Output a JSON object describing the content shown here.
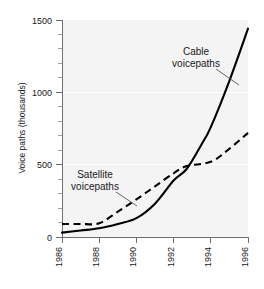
{
  "chart_data": {
    "type": "line",
    "title": "",
    "xlabel": "",
    "ylabel": "Voice paths (thousands)",
    "xlim": [
      1986,
      1996
    ],
    "ylim": [
      0,
      1500
    ],
    "grid": true,
    "legend_position": "inline-annotations",
    "x_ticks": [
      "1986",
      "1988",
      "1990",
      "1992",
      "1994",
      "1996"
    ],
    "x_tick_values": [
      1986,
      1988,
      1990,
      1992,
      1994,
      1996
    ],
    "y_ticks": [
      "0",
      "500",
      "1000",
      "1500"
    ],
    "y_tick_values": [
      0,
      500,
      1000,
      1500
    ],
    "y_minor_step": 100,
    "series": [
      {
        "name": "Cable voicepaths",
        "style": "solid",
        "color": "#000000",
        "x": [
          1986,
          1987,
          1988,
          1989,
          1990,
          1991,
          1992,
          1992.7,
          1993.5,
          1994,
          1995,
          1996
        ],
        "values": [
          30,
          45,
          60,
          90,
          130,
          230,
          390,
          470,
          640,
          760,
          1080,
          1440
        ]
      },
      {
        "name": "Satellite voicepaths",
        "style": "dashed",
        "color": "#000000",
        "x": [
          1986,
          1987,
          1988,
          1989,
          1990,
          1991,
          1992,
          1992.7,
          1994,
          1995,
          1996
        ],
        "values": [
          90,
          90,
          95,
          175,
          260,
          350,
          440,
          490,
          520,
          610,
          720
        ]
      }
    ],
    "annotations": [
      {
        "name": "cable-annotation",
        "line1": "Cable",
        "line2": "voicepaths",
        "text_x": 196,
        "text_y": 55,
        "leader": [
          [
            216,
            68
          ],
          [
            239,
            84
          ]
        ]
      },
      {
        "name": "satellite-annotation",
        "line1": "Satellite",
        "line2": "voicepaths",
        "text_x": 95,
        "text_y": 178,
        "leader": [
          [
            116,
            191
          ],
          [
            137,
            205
          ]
        ]
      }
    ]
  },
  "axes": {
    "y_title": "Voice paths (thousands)"
  }
}
